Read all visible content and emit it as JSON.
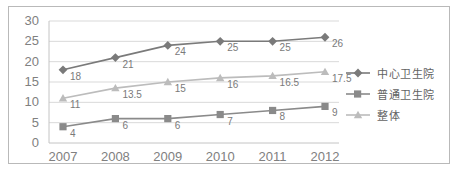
{
  "chart_data": {
    "type": "line",
    "title": "",
    "xlabel": "",
    "ylabel": "",
    "categories": [
      "2007",
      "2008",
      "2009",
      "2010",
      "2011",
      "2012"
    ],
    "ylim": [
      0,
      30
    ],
    "ytick_step": 5,
    "yticks": [
      "0",
      "5",
      "10",
      "15",
      "20",
      "25",
      "30"
    ],
    "grid": "horizontal",
    "legend_position": "right",
    "series": [
      {
        "name": "中心卫生院",
        "marker": "diamond",
        "color": "#7a7a7a",
        "values": [
          18,
          21,
          24,
          25,
          25,
          26
        ],
        "labels": [
          "18",
          "21",
          "24",
          "25",
          "25",
          "26"
        ]
      },
      {
        "name": "普通卫生院",
        "marker": "square",
        "color": "#8a8a8a",
        "values": [
          4,
          6,
          6,
          7,
          8,
          9
        ],
        "labels": [
          "4",
          "6",
          "6",
          "7",
          "8",
          "9"
        ]
      },
      {
        "name": "整体",
        "marker": "triangle",
        "color": "#bcbcbc",
        "values": [
          11,
          13.5,
          15,
          16,
          16.5,
          17.5
        ],
        "labels": [
          "11",
          "13.5",
          "15",
          "16",
          "16.5",
          "17.5"
        ]
      }
    ]
  },
  "caption": {
    "text": ""
  },
  "colors": {
    "frame_border": "#b9b9b9",
    "gridline": "#d9d9d9",
    "axis_text": "#808080",
    "data_label": "#7a7a7a",
    "legend_text": "#636363",
    "background": "#ffffff"
  }
}
